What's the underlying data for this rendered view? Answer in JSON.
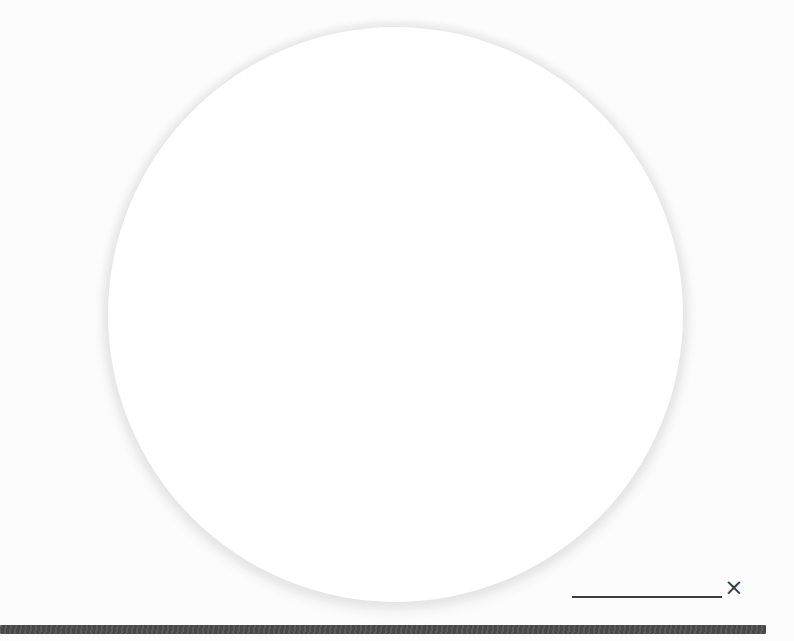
{
  "icons": {
    "close_glyph": "×"
  },
  "colors": {
    "background": "#fcfcfc",
    "circle_fill": "#ffffff",
    "circle_edge": "#e4e4e4",
    "line": "#3c3c3c",
    "icon": "#3a3a3a",
    "bar": "#4d4d4d"
  }
}
